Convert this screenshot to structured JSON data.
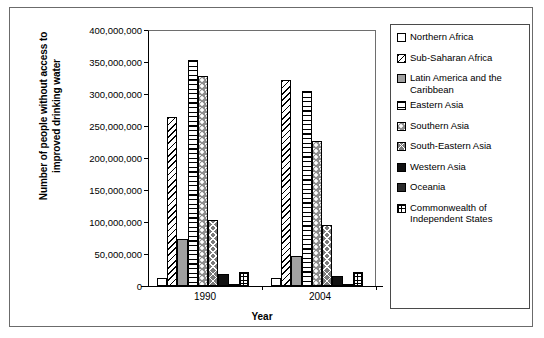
{
  "chart_data": {
    "type": "bar",
    "title": "",
    "xlabel": "Year",
    "ylabel": "Number of people without access to improved drinking water",
    "categories": [
      "1990",
      "2004"
    ],
    "ylim": [
      0,
      400000000
    ],
    "ytick_values": [
      0,
      50000000,
      100000000,
      150000000,
      200000000,
      250000000,
      300000000,
      350000000,
      400000000
    ],
    "ytick_labels": [
      "0",
      "50,000,000",
      "100,000,000",
      "150,000,000",
      "200,000,000",
      "250,000,000",
      "300,000,000",
      "350,000,000",
      "400,000,000"
    ],
    "grid": false,
    "legend_position": "right",
    "series": [
      {
        "name": "Northern Africa",
        "pattern": "empty-white",
        "values": [
          13000000,
          12000000
        ]
      },
      {
        "name": "Sub-Saharan Africa",
        "pattern": "diagonal-hatch",
        "values": [
          264000000,
          322000000
        ]
      },
      {
        "name": "Latin America and the Caribbean",
        "pattern": "solid-gray",
        "values": [
          74000000,
          47000000
        ]
      },
      {
        "name": "Eastern Asia",
        "pattern": "horizontal-lines",
        "values": [
          353000000,
          304000000
        ]
      },
      {
        "name": "Southern Asia",
        "pattern": "dotted-gray",
        "values": [
          328000000,
          227000000
        ]
      },
      {
        "name": "South-Eastern Asia",
        "pattern": "cross-hatch",
        "values": [
          103000000,
          95000000
        ]
      },
      {
        "name": "Western Asia",
        "pattern": "solid-black",
        "values": [
          18000000,
          15000000
        ]
      },
      {
        "name": "Oceania",
        "pattern": "solid-dark-gray",
        "values": [
          3000000,
          3000000
        ]
      },
      {
        "name": "Commonwealth of Independent States",
        "pattern": "fine-grid",
        "values": [
          22000000,
          22000000
        ]
      }
    ]
  },
  "legend": {
    "items": [
      {
        "label": "Northern Africa"
      },
      {
        "label": "Sub-Saharan Africa"
      },
      {
        "label": "Latin America and the Caribbean"
      },
      {
        "label": "Eastern Asia"
      },
      {
        "label": "Southern Asia"
      },
      {
        "label": "South-Eastern Asia"
      },
      {
        "label": "Western Asia"
      },
      {
        "label": "Oceania"
      },
      {
        "label": "Commonwealth of Independent States"
      }
    ]
  },
  "colors": {
    "axis": "#000000",
    "frame": "#6b6b6b",
    "gray_fill": "#a0a0a0",
    "black_fill": "#111111"
  }
}
